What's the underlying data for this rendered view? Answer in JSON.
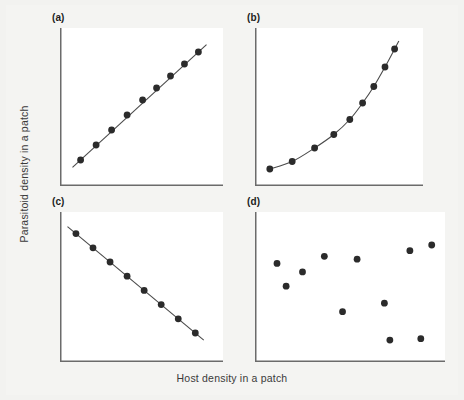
{
  "figure": {
    "xlabel": "Host density in a patch",
    "ylabel": "Parasitoid density in a patch",
    "background_color": "#f2f2f0",
    "plot_background_color": "#ffffff",
    "axis_color": "#6b6b6b",
    "marker_color": "#2b2b2b",
    "line_color": "#4a4a4a"
  },
  "chart_data": [
    {
      "type": "scatter",
      "panel": "(a)",
      "title": "",
      "xlabel": "Host density in a patch",
      "ylabel": "Parasitoid density in a patch",
      "description": "Direct density-dependent aggregation: linear positive relationship",
      "xlim": [
        0,
        100
      ],
      "ylim": [
        0,
        100
      ],
      "grid": false,
      "legend": "none",
      "trend": "linear-increasing",
      "x": [
        12,
        22,
        32,
        42,
        52,
        61,
        70,
        79,
        88
      ],
      "y": [
        16,
        26,
        36,
        46,
        56,
        64,
        72,
        80,
        88
      ]
    },
    {
      "type": "scatter",
      "panel": "(b)",
      "title": "",
      "xlabel": "Host density in a patch",
      "ylabel": "Parasitoid density in a patch",
      "description": "Accelerating density-dependent aggregation: exponential positive relationship",
      "xlim": [
        0,
        100
      ],
      "ylim": [
        0,
        100
      ],
      "grid": false,
      "legend": "none",
      "trend": "exponential-increasing",
      "x": [
        8,
        22,
        36,
        48,
        58,
        66,
        73,
        80,
        86
      ],
      "y": [
        10,
        15,
        24,
        33,
        43,
        54,
        65,
        78,
        90
      ]
    },
    {
      "type": "scatter",
      "panel": "(c)",
      "title": "",
      "xlabel": "Host density in a patch",
      "ylabel": "Parasitoid density in a patch",
      "description": "Inverse density-dependent aggregation: linear negative relationship",
      "xlim": [
        0,
        100
      ],
      "ylim": [
        0,
        100
      ],
      "grid": false,
      "legend": "none",
      "trend": "linear-decreasing",
      "x": [
        9,
        20,
        31,
        42,
        53,
        64,
        75,
        86
      ],
      "y": [
        89,
        79,
        69,
        59,
        49,
        39,
        29,
        19
      ]
    },
    {
      "type": "scatter",
      "panel": "(d)",
      "title": "",
      "xlabel": "Host density in a patch",
      "ylabel": "Parasitoid density in a patch",
      "description": "Density-independent aggregation: no relationship, random scatter",
      "xlim": [
        0,
        100
      ],
      "ylim": [
        0,
        100
      ],
      "grid": false,
      "legend": "none",
      "trend": "none",
      "x": [
        11,
        16,
        25,
        37,
        47,
        55,
        70,
        73,
        84,
        90,
        96
      ],
      "y": [
        68,
        52,
        62,
        73,
        34,
        71,
        40,
        14,
        77,
        15,
        81
      ]
    }
  ],
  "panels": [
    {
      "label": "(a)"
    },
    {
      "label": "(b)"
    },
    {
      "label": "(c)"
    },
    {
      "label": "(d)"
    }
  ]
}
